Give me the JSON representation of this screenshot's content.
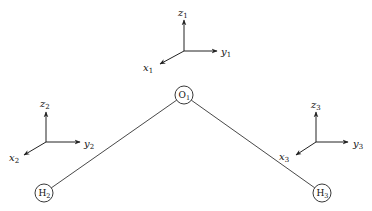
{
  "diagram": {
    "type": "molecule-coordinate-frames",
    "atoms": [
      {
        "id": "O1",
        "symbol": "O",
        "subscript": "1",
        "cx": 184,
        "cy": 95,
        "r": 9
      },
      {
        "id": "H2",
        "symbol": "H",
        "subscript": "2",
        "cx": 44,
        "cy": 193,
        "r": 9
      },
      {
        "id": "H3",
        "symbol": "H",
        "subscript": "3",
        "cx": 322,
        "cy": 193,
        "r": 9
      }
    ],
    "bonds": [
      {
        "from": "O1",
        "to": "H2"
      },
      {
        "from": "O1",
        "to": "H3"
      }
    ],
    "frames": [
      {
        "id": "frame1",
        "origin": [
          184,
          51
        ],
        "axes": {
          "z": {
            "name": "z",
            "subscript": "1",
            "tip": [
              184,
              20
            ],
            "label_pos": [
              178,
              16
            ]
          },
          "y": {
            "name": "y",
            "subscript": "1",
            "tip": [
              217,
              51
            ],
            "label_pos": [
              221,
              55
            ]
          },
          "x": {
            "name": "x",
            "subscript": "1",
            "tip": [
              160,
              64
            ],
            "label_pos": [
              143,
              71
            ]
          }
        }
      },
      {
        "id": "frame2",
        "origin": [
          46,
          142
        ],
        "axes": {
          "z": {
            "name": "z",
            "subscript": "2",
            "tip": [
              46,
              112
            ],
            "label_pos": [
              40,
              107
            ]
          },
          "y": {
            "name": "y",
            "subscript": "2",
            "tip": [
              80,
              142
            ],
            "label_pos": [
              84,
              147
            ]
          },
          "x": {
            "name": "x",
            "subscript": "2",
            "tip": [
              24,
              155
            ],
            "label_pos": [
              9,
              161
            ]
          }
        }
      },
      {
        "id": "frame3",
        "origin": [
          316,
          142
        ],
        "axes": {
          "z": {
            "name": "z",
            "subscript": "3",
            "tip": [
              316,
              112
            ],
            "label_pos": [
              311,
              108
            ]
          },
          "y": {
            "name": "y",
            "subscript": "3",
            "tip": [
              348,
              142
            ],
            "label_pos": [
              353,
              147
            ]
          },
          "x": {
            "name": "x",
            "subscript": "3",
            "tip": [
              296,
              155
            ],
            "label_pos": [
              279,
              160
            ]
          }
        }
      }
    ],
    "colors": {
      "line": "#222222",
      "background": "#ffffff"
    }
  }
}
